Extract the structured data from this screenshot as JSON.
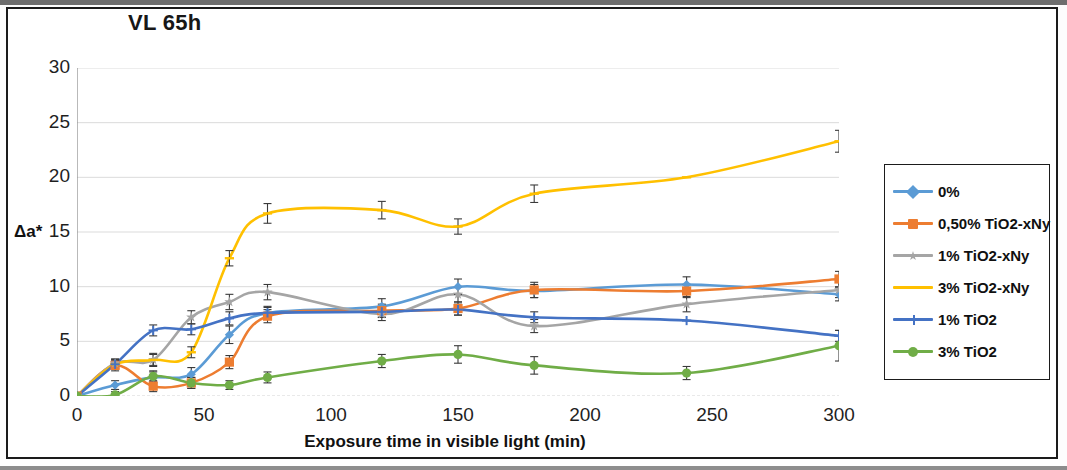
{
  "chart_data": {
    "type": "line",
    "title": "VL 65h",
    "xlabel": "Exposure time in visible light (min)",
    "ylabel": "Δa*",
    "xlim": [
      0,
      300
    ],
    "ylim": [
      0,
      30
    ],
    "xticks": [
      0,
      50,
      100,
      150,
      200,
      250,
      300
    ],
    "yticks": [
      0,
      5,
      10,
      15,
      20,
      25,
      30
    ],
    "grid": "horizontal",
    "legend_position": "right",
    "x": [
      0,
      15,
      30,
      45,
      60,
      75,
      120,
      150,
      180,
      240,
      300
    ],
    "series": [
      {
        "name": "0%",
        "color": "#5B9BD5",
        "marker": "diamond",
        "values": [
          0,
          1.0,
          1.7,
          2.0,
          5.6,
          7.6,
          8.2,
          10.0,
          9.6,
          10.2,
          9.3
        ],
        "errors": [
          0,
          0.4,
          0.5,
          0.6,
          0.8,
          0.6,
          0.7,
          0.7,
          0.6,
          0.7,
          0.6
        ]
      },
      {
        "name": "0,50% TiO2-xNy",
        "color": "#ED7D31",
        "marker": "square",
        "values": [
          0,
          2.8,
          0.9,
          1.2,
          3.1,
          7.3,
          7.8,
          8.0,
          9.7,
          9.6,
          10.7
        ],
        "errors": [
          0,
          0.5,
          0.5,
          0.5,
          0.6,
          0.6,
          0.6,
          0.6,
          0.7,
          0.6,
          0.7
        ]
      },
      {
        "name": "1% TiO2-xNy",
        "color": "#A5A5A5",
        "marker": "star",
        "values": [
          0,
          3.0,
          3.3,
          7.2,
          8.6,
          9.5,
          7.5,
          9.3,
          6.4,
          8.4,
          9.7
        ],
        "errors": [
          0,
          0.4,
          0.6,
          0.6,
          0.7,
          0.7,
          0.6,
          0.7,
          0.6,
          0.7,
          0.7
        ]
      },
      {
        "name": "3% TiO2-xNy",
        "color": "#FFC000",
        "marker": "line",
        "values": [
          0,
          2.9,
          3.3,
          4.0,
          12.6,
          16.7,
          17.0,
          15.5,
          18.5,
          20.0,
          23.3
        ],
        "errors": [
          0,
          0.4,
          0.5,
          0.5,
          0.7,
          0.9,
          0.8,
          0.7,
          0.8,
          0.0,
          1.0
        ]
      },
      {
        "name": "1% TiO2",
        "color": "#4472C4",
        "marker": "plus",
        "values": [
          0,
          2.9,
          6.0,
          6.1,
          7.1,
          7.6,
          7.7,
          7.9,
          7.2,
          6.9,
          5.5
        ],
        "errors": [
          0,
          0.4,
          0.5,
          0.5,
          0.6,
          0.5,
          0.5,
          0.5,
          0.5,
          0.0,
          0.5
        ]
      },
      {
        "name": "3% TiO2",
        "color": "#70AD47",
        "marker": "circle",
        "values": [
          0,
          0.1,
          1.8,
          1.2,
          1.0,
          1.7,
          3.2,
          3.8,
          2.8,
          2.1,
          4.6
        ],
        "errors": [
          0,
          0.3,
          0.5,
          0.5,
          0.4,
          0.5,
          0.6,
          0.8,
          0.8,
          0.6,
          1.4
        ]
      }
    ]
  },
  "legend": {
    "items": [
      {
        "label": "0%"
      },
      {
        "label": "0,50% TiO2-xNy"
      },
      {
        "label": "1% TiO2-xNy"
      },
      {
        "label": "3% TiO2-xNy"
      },
      {
        "label": "1% TiO2"
      },
      {
        "label": "3% TiO2"
      }
    ]
  }
}
